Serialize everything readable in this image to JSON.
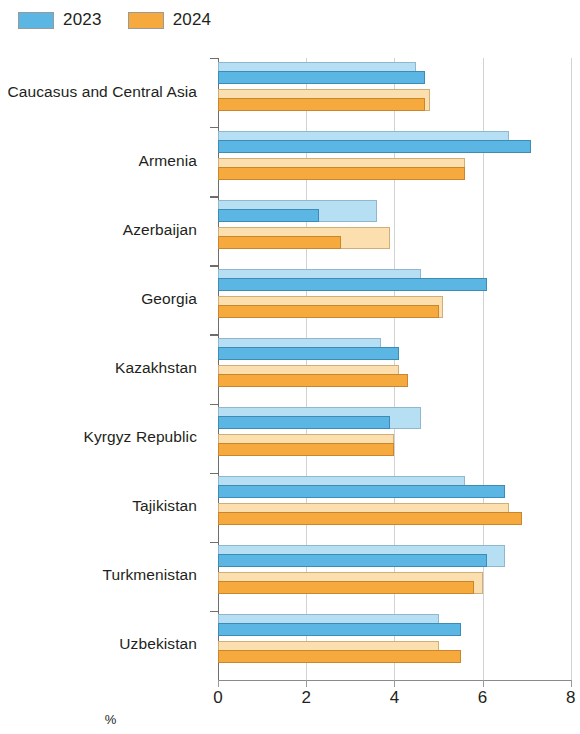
{
  "legend": {
    "items": [
      {
        "label": "2023",
        "color": "#5cb6e3"
      },
      {
        "label": "2024",
        "color": "#f6aa3d"
      }
    ]
  },
  "axis": {
    "x_title": "%",
    "ticks": [
      "0",
      "2",
      "4",
      "6",
      "8"
    ]
  },
  "chart_data": {
    "type": "bar",
    "orientation": "horizontal",
    "title": "",
    "subtitle": "",
    "xlabel": "%",
    "ylabel": "",
    "xlim": [
      0,
      8
    ],
    "xticks": [
      0,
      2,
      4,
      6,
      8
    ],
    "grid": true,
    "legend_position": "top-left",
    "legend": [
      "2023",
      "2024"
    ],
    "categories": [
      "Caucasus and Central Asia",
      "Armenia",
      "Azerbaijan",
      "Georgia",
      "Kazakhstan",
      "Kyrgyz Republic",
      "Tajikistan",
      "Turkmenistan",
      "Uzbekistan"
    ],
    "series": [
      {
        "name": "2023 previous",
        "color": "#b7dff4",
        "values": [
          4.5,
          6.6,
          3.6,
          4.6,
          3.7,
          4.6,
          5.6,
          6.5,
          5.0
        ]
      },
      {
        "name": "2023 current",
        "color": "#5cb6e3",
        "values": [
          4.7,
          7.1,
          2.3,
          6.1,
          4.1,
          3.9,
          6.5,
          6.1,
          5.5
        ]
      },
      {
        "name": "2024 previous",
        "color": "#fbdfae",
        "values": [
          4.8,
          5.6,
          3.9,
          5.1,
          4.1,
          4.0,
          6.6,
          6.0,
          5.0
        ]
      },
      {
        "name": "2024 current",
        "color": "#f6aa3d",
        "values": [
          4.7,
          5.6,
          2.8,
          5.0,
          4.3,
          4.0,
          6.9,
          5.8,
          5.5
        ]
      }
    ]
  },
  "geometry": {
    "x0": 218,
    "px_per_unit": 44.1,
    "plot_top": 58,
    "group_height": 69.1,
    "bar_height": 13.2
  }
}
